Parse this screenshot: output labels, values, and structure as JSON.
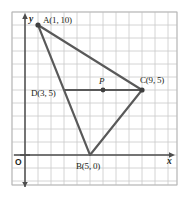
{
  "figure": {
    "type": "coordinate-geometry-diagram",
    "grid": {
      "cell_px": 13,
      "origin_px": {
        "x": 25,
        "y": 155
      },
      "frame_px": {
        "left": 12,
        "top": 12,
        "right": 177,
        "bottom": 185
      },
      "grid_color": "#c9c9c9",
      "axis_color": "#4d4d4d",
      "shape_color": "#595959",
      "show_grid": true,
      "show_tick_labels": false
    },
    "axes": {
      "x_label": "x",
      "y_label": "y",
      "origin_label": "O"
    },
    "points": [
      {
        "name": "A",
        "label": "A(1, 10)",
        "x": 1,
        "y": 10,
        "dot": true,
        "label_pos": "right"
      },
      {
        "name": "B",
        "label": "B(5, 0)",
        "x": 5,
        "y": 0,
        "dot": false,
        "label_pos": "below"
      },
      {
        "name": "C",
        "label": "C(9, 5)",
        "x": 9,
        "y": 5,
        "dot": true,
        "label_pos": "above-right"
      },
      {
        "name": "D",
        "label": "D(3, 5)",
        "x": 3,
        "y": 5,
        "dot": false,
        "label_pos": "left"
      },
      {
        "name": "P",
        "label": "P",
        "x": 6,
        "y": 5,
        "dot": true,
        "label_pos": "above"
      }
    ],
    "segments": [
      {
        "name": "AB",
        "from": "A",
        "to": "B"
      },
      {
        "name": "BC",
        "from": "B",
        "to": "C"
      },
      {
        "name": "CA",
        "from": "C",
        "to": "A"
      },
      {
        "name": "DC",
        "from": "D",
        "to": "C"
      }
    ]
  }
}
